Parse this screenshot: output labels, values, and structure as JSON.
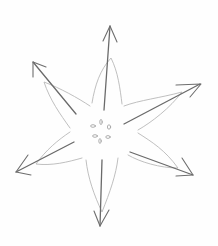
{
  "image": {
    "description": "Pencil sketch of a six-petaled flower with an arrow extending through each petal",
    "style": "graphite pencil on white paper",
    "colors": {
      "background": "#fefefe",
      "petal_outline": "#b4b4b4",
      "arrow_stroke": "#6a6a6a",
      "center_marks": "#9a9a9a"
    },
    "petal_count": 6,
    "arrow_count": 6,
    "arrow_directions": [
      "up",
      "upper-left",
      "upper-right",
      "lower-left",
      "lower-right",
      "down"
    ],
    "center_seed_marks": 6
  }
}
